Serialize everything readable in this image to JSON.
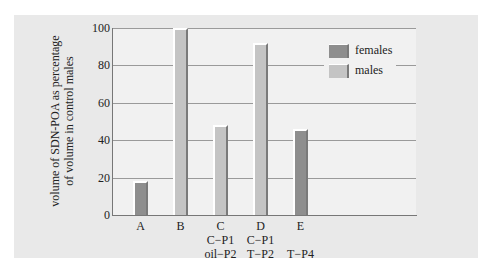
{
  "chart_data": {
    "type": "bar",
    "title": "",
    "xlabel": "",
    "ylabel": "volume of SDN-POA as percentage of volume in control males",
    "ylabel_lines": [
      "volume of SDN-POA as percentage",
      "of volume in control males"
    ],
    "ylim": [
      0,
      100
    ],
    "yticks": [
      0,
      20,
      40,
      60,
      80,
      100
    ],
    "grid": true,
    "legend_position": "upper right",
    "legend": [
      {
        "name": "females",
        "color": "#8e8e8e"
      },
      {
        "name": "males",
        "color": "#c4c4c4"
      }
    ],
    "categories": [
      {
        "label": "A",
        "sub": [
          "",
          ""
        ],
        "group": "females",
        "value": 18
      },
      {
        "label": "B",
        "sub": [
          "",
          ""
        ],
        "group": "males",
        "value": 100
      },
      {
        "label": "C",
        "sub": [
          "C−P1",
          "oil−P2"
        ],
        "group": "males",
        "value": 48
      },
      {
        "label": "D",
        "sub": [
          "C−P1",
          "T−P2"
        ],
        "group": "males",
        "value": 92
      },
      {
        "label": "E",
        "sub": [
          "",
          "T−P4"
        ],
        "group": "females",
        "value": 46
      }
    ]
  }
}
